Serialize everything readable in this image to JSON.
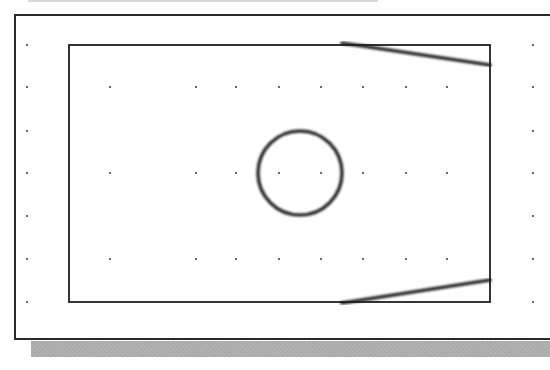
{
  "diagram": {
    "type": "cad-sketch",
    "colors": {
      "background": "#ffffff",
      "frame": "#2a2a2a",
      "geometry": "#1e1e1e",
      "grid_dot": "#444444",
      "shadow": "#adadad"
    },
    "frame": {
      "x": 14,
      "y": 14,
      "height": 326
    },
    "rectangle": {
      "x": 69,
      "y": 45,
      "width": 421,
      "height": 257
    },
    "vertical_lines": [
      {
        "x": 153,
        "y1": 45,
        "y2": 302
      }
    ],
    "horizontal_lines": [
      {
        "y": 130,
        "x1": 69,
        "x2": 490
      },
      {
        "y": 216,
        "x1": 69,
        "x2": 490
      }
    ],
    "slanted_lines": [
      {
        "x1": 342,
        "y1": 43,
        "x2": 490,
        "y2": 65
      },
      {
        "x1": 342,
        "y1": 303,
        "x2": 490,
        "y2": 280
      }
    ],
    "circle": {
      "cx": 300,
      "cy": 173,
      "r": 42
    },
    "grid": {
      "outer_columns_x": [
        27,
        533
      ],
      "outer_rows_y": [
        45,
        87,
        131,
        173,
        216,
        259,
        302
      ],
      "inner_columns_x": [
        110,
        196,
        236,
        279,
        321,
        363,
        406,
        447
      ],
      "inner_rows_y": [
        87,
        173,
        259
      ]
    }
  }
}
